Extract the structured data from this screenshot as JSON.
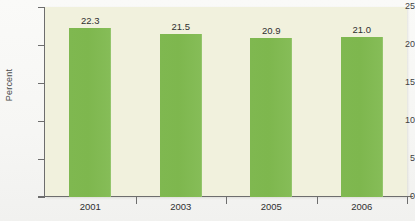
{
  "chart_data": {
    "type": "bar",
    "title": "",
    "xlabel": "",
    "ylabel": "Percent",
    "categories": [
      "2001",
      "2003",
      "2005",
      "2006"
    ],
    "values": [
      22.3,
      21.5,
      20.9,
      21.0
    ],
    "value_labels": [
      "22.3",
      "21.5",
      "20.9",
      "21.0"
    ],
    "ylim": [
      0,
      25
    ],
    "yticks": [
      0,
      5,
      10,
      15,
      20,
      25
    ],
    "ytick_labels": [
      "0",
      "5",
      "10",
      "15",
      "20",
      "25"
    ],
    "grid": false,
    "legend": null,
    "series": [
      {
        "name": "Percent",
        "values": [
          22.3,
          21.5,
          20.9,
          21.0
        ]
      }
    ]
  },
  "colors": {
    "bar": "#7fb850",
    "plot_background": "#f1f1dd",
    "page_background": "#fdfdfb",
    "axis": "#6d6d6d",
    "text": "#2f2f2f"
  }
}
